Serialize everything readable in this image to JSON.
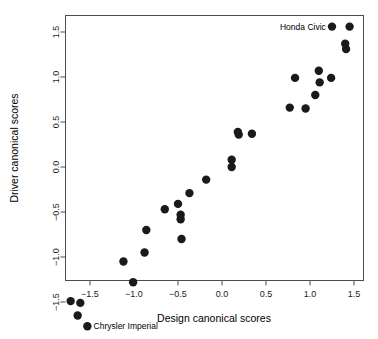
{
  "chart_data": {
    "type": "scatter",
    "title": "",
    "xlabel": "Design canonical scores",
    "ylabel": "Driver canonical scores",
    "xlim": [
      -1.86,
      1.53
    ],
    "ylim": [
      -1.86,
      1.7
    ],
    "xticks": [
      -1.5,
      -1.0,
      -0.5,
      0.0,
      0.5,
      1.0,
      1.5
    ],
    "xticklabels": [
      "-1.5",
      "-1.0",
      "-0.5",
      "0.0",
      "0.5",
      "1.0",
      "1.5"
    ],
    "yticks": [
      -1.5,
      -1.0,
      -0.5,
      0.0,
      0.5,
      1.0,
      1.5
    ],
    "yticklabels": [
      "-1.5",
      "-1.0",
      "-0.5",
      "0.0",
      "0.5",
      "1.0",
      "1.5"
    ],
    "grid": false,
    "legend": false,
    "marker": "filled-circle",
    "marker_color": "#1a1a1a",
    "marker_size": 4.2,
    "points": [
      {
        "x": -1.72,
        "y": -1.49
      },
      {
        "x": -1.64,
        "y": -1.65
      },
      {
        "x": -1.61,
        "y": -1.51
      },
      {
        "x": -1.53,
        "y": -1.77,
        "label": "Chrysler Imperial",
        "label_pos": "right"
      },
      {
        "x": -1.12,
        "y": -1.05
      },
      {
        "x": -1.01,
        "y": -1.28
      },
      {
        "x": -0.88,
        "y": -0.95
      },
      {
        "x": -0.86,
        "y": -0.7
      },
      {
        "x": -0.65,
        "y": -0.47
      },
      {
        "x": -0.5,
        "y": -0.41
      },
      {
        "x": -0.47,
        "y": -0.53
      },
      {
        "x": -0.47,
        "y": -0.58
      },
      {
        "x": -0.46,
        "y": -0.8
      },
      {
        "x": -0.37,
        "y": -0.29
      },
      {
        "x": -0.18,
        "y": -0.14
      },
      {
        "x": 0.11,
        "y": 0.08
      },
      {
        "x": 0.11,
        "y": 0.0
      },
      {
        "x": 0.18,
        "y": 0.39
      },
      {
        "x": 0.19,
        "y": 0.36
      },
      {
        "x": 0.34,
        "y": 0.37
      },
      {
        "x": 0.77,
        "y": 0.66
      },
      {
        "x": 0.83,
        "y": 0.99
      },
      {
        "x": 0.95,
        "y": 0.65
      },
      {
        "x": 1.06,
        "y": 0.8
      },
      {
        "x": 1.1,
        "y": 1.07
      },
      {
        "x": 1.11,
        "y": 0.94
      },
      {
        "x": 1.24,
        "y": 0.99
      },
      {
        "x": 1.25,
        "y": 1.56,
        "label": "Honda Civic",
        "label_pos": "left"
      },
      {
        "x": 1.4,
        "y": 1.37
      },
      {
        "x": 1.41,
        "y": 1.31
      },
      {
        "x": 1.45,
        "y": 1.56
      }
    ],
    "annotations": [
      {
        "text": "Honda Civic",
        "x": 1.25,
        "y": 1.56,
        "placement": "left"
      },
      {
        "text": "Chrysler Imperial",
        "x": -1.53,
        "y": -1.77,
        "placement": "right"
      }
    ]
  }
}
